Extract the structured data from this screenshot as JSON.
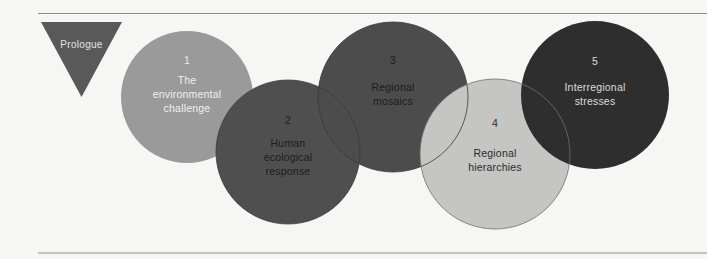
{
  "figure": {
    "background_color": "#f6f6f4",
    "rules": {
      "color": "#8d8d8d",
      "top_label": "top-divider-rule",
      "bottom_label": "bottom-divider-rule"
    },
    "prologue": {
      "label": "Prologue",
      "shape": "triangle-down",
      "fill": "#595959",
      "text_color": "#e3e3e1"
    },
    "nodes": [
      {
        "number": "1",
        "title_lines": [
          "The",
          "environmental",
          "challenge"
        ],
        "fill": "#9a9a9a",
        "text_color": "#f0f0ee",
        "shape": "circle"
      },
      {
        "number": "2",
        "title_lines": [
          "Human",
          "ecological",
          "response"
        ],
        "fill": "#4f4f4f",
        "text_color": "#1c1c1c",
        "shape": "circle"
      },
      {
        "number": "3",
        "title_lines": [
          "Regional",
          "mosaics"
        ],
        "fill": "#4c4c4c",
        "text_color": "#1c1c1c",
        "shape": "circle"
      },
      {
        "number": "4",
        "title_lines": [
          "Regional",
          "hierarchies"
        ],
        "fill": "#c5c5c3",
        "text_color": "#2b2b2b",
        "shape": "circle"
      },
      {
        "number": "5",
        "title_lines": [
          "Interregional",
          "stresses"
        ],
        "fill": "#2e2e2e",
        "text_color": "#dcdcda",
        "shape": "circle"
      }
    ]
  }
}
